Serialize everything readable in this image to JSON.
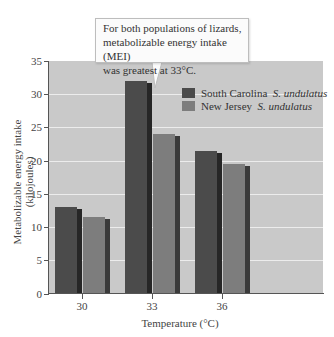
{
  "chart_data": {
    "type": "bar",
    "title": "",
    "annotation": "For both populations of lizards, metabolizable energy intake (MEI) was greatest at 33°C.",
    "annotation_lines": [
      "For both populations of lizards,",
      "metabolizable energy intake (MEI)",
      "was greatest at 33°C."
    ],
    "xlabel": "Temperature (°C)",
    "ylabel": "Metabolizable energy intake (kilojoules)",
    "categories": [
      "30",
      "33",
      "36"
    ],
    "series": [
      {
        "name": "South Carolina S. undulatus",
        "region": "South Carolina",
        "species": "S. undulatus",
        "color": "#4b4b4b",
        "values": [
          13,
          32,
          21.5
        ]
      },
      {
        "name": "New Jersey S. undulatus",
        "region": "New Jersey",
        "species": "S. undulatus",
        "color": "#7d7d7d",
        "values": [
          11.5,
          24,
          19.5
        ]
      }
    ],
    "ylim": [
      0,
      35
    ],
    "yticks": [
      "0",
      "5",
      "10",
      "15",
      "20",
      "25",
      "30",
      "35"
    ],
    "grid": true,
    "legend_position": "upper right (inside plot)"
  }
}
